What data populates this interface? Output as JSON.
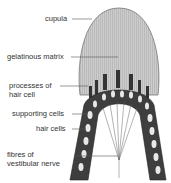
{
  "diagram": {
    "labels": {
      "cupula": "cupula",
      "gelatinous_matrix": "gelatinous matrix",
      "processes_1": "processes of",
      "processes_2": "hair cell",
      "supporting_cells": "supporting cells",
      "hair_cells": "hair cells",
      "fibres_1": "fibres of",
      "fibres_2": "vestibular nerve"
    },
    "colors": {
      "cupula_fill": "#c8c8c8",
      "tissue_dark": "#4a4a4a",
      "line": "#555555"
    }
  }
}
